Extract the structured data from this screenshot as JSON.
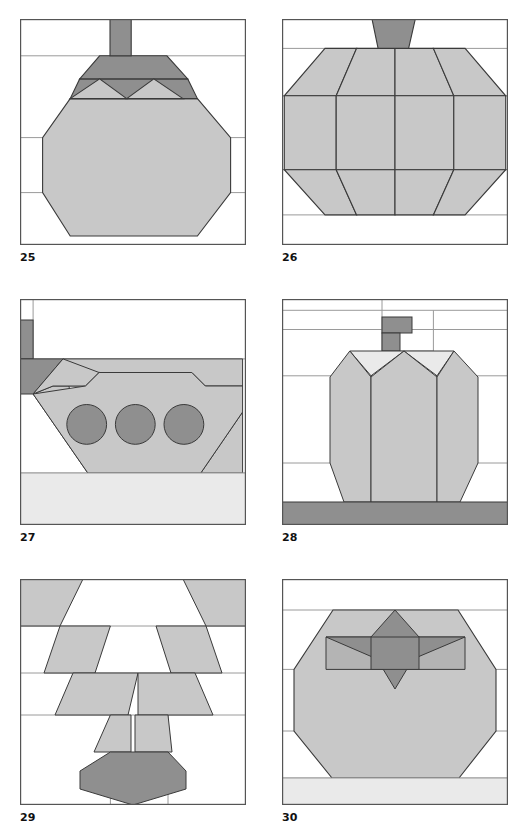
{
  "page": {
    "kind": "quilt-block-pattern-sheet",
    "columns": 2,
    "rows": 3,
    "background_color": "#ffffff"
  },
  "palette": {
    "white": "#ffffff",
    "pale_gray": "#eaeaea",
    "light_gray": "#c8c8c8",
    "mid_gray": "#b4b4b4",
    "dark_gray": "#8f8f8f",
    "outline": "#3a3a3a",
    "grid_line": "#9a9a9a",
    "label_color": "#111111"
  },
  "blocks": [
    {
      "label": "25",
      "name": "eggplant-block",
      "position": "row1-left",
      "grid_lines_h": [
        0.163,
        0.525,
        0.768
      ],
      "grid_lines_v": [
        0.352,
        0.653
      ],
      "shapes": [
        {
          "id": "stem",
          "fill": "dark_gray",
          "points": "0.398,0.000 0.492,0.000 0.492,0.163 0.398,0.163"
        },
        {
          "id": "cap-trapezoid",
          "fill": "dark_gray",
          "points": "0.352,0.163 0.650,0.163 0.742,0.265 0.264,0.265"
        },
        {
          "id": "cap-band-left-wedge",
          "fill": "dark_gray",
          "points": "0.264,0.265 0.742,0.265 0.785,0.352 0.222,0.352"
        },
        {
          "id": "leaf-point-left",
          "fill": "light_gray",
          "points": "0.222,0.352 0.352,0.265 0.472,0.352"
        },
        {
          "id": "leaf-point-right",
          "fill": "light_gray",
          "points": "0.472,0.352 0.592,0.265 0.722,0.352"
        },
        {
          "id": "body-octagon",
          "fill": "light_gray",
          "points": "0.222,0.352 0.785,0.352 0.932,0.525 0.932,0.768 0.785,0.960 0.222,0.960 0.100,0.768 0.100,0.525"
        }
      ]
    },
    {
      "label": "26",
      "name": "pumpkin-block",
      "position": "row1-right",
      "grid_lines_h": [
        0.13,
        0.34,
        0.667,
        0.867
      ],
      "grid_lines_v": [
        0.5
      ],
      "shapes": [
        {
          "id": "stem",
          "fill": "dark_gray",
          "points": "0.398,0.000 0.590,0.000 0.560,0.130 0.425,0.130"
        },
        {
          "id": "lobe-outer-left",
          "fill": "light_gray",
          "points": "0.190,0.130 0.330,0.130 0.240,0.340 0.010,0.340"
        },
        {
          "id": "lobe-inner-left",
          "fill": "light_gray",
          "points": "0.330,0.130 0.500,0.130 0.500,0.340 0.240,0.340"
        },
        {
          "id": "lobe-inner-right",
          "fill": "light_gray",
          "points": "0.500,0.130 0.670,0.130 0.760,0.340 0.500,0.340"
        },
        {
          "id": "lobe-outer-right",
          "fill": "light_gray",
          "points": "0.670,0.130 0.810,0.130 0.990,0.340 0.760,0.340"
        },
        {
          "id": "mid-band-far-left",
          "fill": "light_gray",
          "points": "0.010,0.340 0.240,0.340 0.240,0.667 0.010,0.667"
        },
        {
          "id": "mid-band-left",
          "fill": "light_gray",
          "points": "0.240,0.340 0.500,0.340 0.500,0.667 0.240,0.667"
        },
        {
          "id": "mid-band-right",
          "fill": "light_gray",
          "points": "0.500,0.340 0.760,0.340 0.760,0.667 0.500,0.667"
        },
        {
          "id": "mid-band-far-right",
          "fill": "light_gray",
          "points": "0.760,0.340 0.990,0.340 0.990,0.667 0.760,0.667"
        },
        {
          "id": "lobe-bottom-outer-left",
          "fill": "light_gray",
          "points": "0.010,0.667 0.240,0.667 0.330,0.867 0.190,0.867"
        },
        {
          "id": "lobe-bottom-inner-left",
          "fill": "light_gray",
          "points": "0.240,0.667 0.500,0.667 0.500,0.867 0.330,0.867"
        },
        {
          "id": "lobe-bottom-inner-right",
          "fill": "light_gray",
          "points": "0.500,0.667 0.760,0.667 0.670,0.867 0.500,0.867"
        },
        {
          "id": "lobe-bottom-outer-right",
          "fill": "light_gray",
          "points": "0.760,0.667 0.990,0.667 0.810,0.867 0.670,0.867"
        }
      ]
    },
    {
      "label": "27",
      "name": "basket-block",
      "position": "row2-left",
      "grid_lines_h": [
        0.265,
        0.77
      ],
      "grid_lines_v": [],
      "shapes": [
        {
          "id": "handle-upper",
          "fill": "dark_gray",
          "points": "0.000,0.093 0.058,0.093 0.058,0.265 0.000,0.265"
        },
        {
          "id": "handle-corner-wedge",
          "fill": "dark_gray",
          "points": "0.000,0.265 0.190,0.265 0.058,0.420 0.000,0.420"
        },
        {
          "id": "basket-body",
          "fill": "light_gray",
          "points": "0.190,0.265 0.985,0.265 0.985,0.500 0.800,0.770 0.300,0.770 0.058,0.420 0.110,0.385 0.290,0.385 0.350,0.325 0.760,0.325 0.820,0.385 0.985,0.385"
        },
        {
          "id": "basket-interior-cut",
          "fill": "white",
          "points": "0.230,0.265 0.950,0.265 0.800,0.325 0.350,0.325 0.290,0.385 0.145,0.385"
        },
        {
          "id": "egg-left",
          "fill": "dark_gray",
          "cx": 0.295,
          "cy": 0.555,
          "r": 0.088
        },
        {
          "id": "egg-center",
          "fill": "dark_gray",
          "cx": 0.51,
          "cy": 0.555,
          "r": 0.088
        },
        {
          "id": "egg-right",
          "fill": "dark_gray",
          "cx": 0.725,
          "cy": 0.555,
          "r": 0.088
        },
        {
          "id": "ground-strip",
          "fill": "pale_gray",
          "points": "0.000,0.770 1.000,0.770 1.000,1.000 0.000,1.000"
        }
      ]
    },
    {
      "label": "28",
      "name": "bell-pepper-block",
      "position": "row2-right",
      "grid_lines_h": [
        0.13,
        0.385,
        0.77,
        0.9
      ],
      "grid_lines_v": [
        0.46,
        0.68
      ],
      "shapes": [
        {
          "id": "stem-upper",
          "fill": "dark_gray",
          "points": "0.460,0.175 0.600,0.175 0.600,0.255 0.460,0.255"
        },
        {
          "id": "stem-lower",
          "fill": "dark_gray",
          "points": "0.460,0.255 0.545,0.255 0.545,0.385 0.460,0.385"
        },
        {
          "id": "shoulder-highlight",
          "fill": "pale_gray",
          "points": "0.300,0.385 0.760,0.385 0.690,0.460 0.540,0.385 0.390,0.460"
        },
        {
          "id": "lobe-left",
          "fill": "light_gray",
          "points": "0.300,0.385 0.390,0.470 0.390,0.900 0.300,0.900 0.200,0.770 0.210,0.470"
        },
        {
          "id": "lobe-center",
          "fill": "light_gray",
          "points": "0.390,0.470 0.540,0.385 0.690,0.470 0.690,0.900 0.390,0.900"
        },
        {
          "id": "lobe-right",
          "fill": "light_gray",
          "points": "0.690,0.470 0.790,0.385 0.880,0.470 0.870,0.770 0.790,0.900 0.690,0.900"
        },
        {
          "id": "base-shadow",
          "fill": "dark_gray",
          "points": "0.000,0.900 1.000,0.900 1.000,1.000 0.000,1.000"
        }
      ]
    },
    {
      "label": "29",
      "name": "beet-block",
      "position": "row3-left",
      "grid_lines_h": [
        0.225,
        0.45,
        0.64
      ],
      "grid_lines_v": [
        0.4,
        0.64
      ],
      "shapes": [
        {
          "id": "leaf-top-left",
          "fill": "light_gray",
          "points": "0.000,0.000 0.280,0.000 0.180,0.225 0.000,0.225"
        },
        {
          "id": "leaf-top-right",
          "fill": "light_gray",
          "points": "0.720,0.000 1.000,0.000 1.000,0.225 0.820,0.225"
        },
        {
          "id": "leaf-mid-left",
          "fill": "light_gray",
          "points": "0.180,0.225 0.400,0.225 0.330,0.450 0.105,0.450"
        },
        {
          "id": "leaf-mid-right",
          "fill": "light_gray",
          "points": "0.600,0.225 0.820,0.225 0.895,0.450 0.670,0.450"
        },
        {
          "id": "leaf-low-left",
          "fill": "light_gray",
          "points": "0.235,0.450 0.520,0.450 0.480,0.640 0.155,0.640"
        },
        {
          "id": "leaf-low-right",
          "fill": "light_gray",
          "points": "0.520,0.450 0.775,0.450 0.855,0.640 0.520,0.640"
        },
        {
          "id": "leaf-stem-left",
          "fill": "light_gray",
          "points": "0.400,0.640 0.490,0.640 0.490,0.800 0.330,0.800"
        },
        {
          "id": "leaf-stem-right",
          "fill": "light_gray",
          "points": "0.510,0.640 0.640,0.640 0.660,0.800 0.510,0.800"
        },
        {
          "id": "root-body",
          "fill": "dark_gray",
          "points": "0.400,0.800 0.640,0.800 0.735,0.880 0.735,1.000 0.575,1.000 0.305,1.000 0.305,0.880"
        }
      ]
    },
    {
      "label": "30",
      "name": "tomato-block",
      "position": "row3-right",
      "grid_lines_h": [
        0.155,
        0.4,
        0.66,
        0.88
      ],
      "grid_lines_v": [],
      "shapes": [
        {
          "id": "fruit-octagon",
          "fill": "light_gray",
          "points": "0.220,0.155 0.780,0.155 0.980,0.400 0.980,0.660 0.790,0.880 0.215,0.880 0.050,0.660 0.050,0.400"
        },
        {
          "id": "calyx-band",
          "fill": "mid_gray",
          "points": "0.200,0.290 0.800,0.290 0.800,0.400 0.200,0.400"
        },
        {
          "id": "calyx-star",
          "fill": "dark_gray",
          "points": "0.500,0.155 0.610,0.290 0.800,0.290 0.580,0.360 0.500,0.480 0.420,0.360 0.200,0.290 0.390,0.290"
        },
        {
          "id": "calyx-core",
          "fill": "dark_gray",
          "points": "0.420,0.290 0.580,0.290 0.580,0.400 0.420,0.400"
        },
        {
          "id": "ground-strip",
          "fill": "pale_gray",
          "points": "0.000,0.880 1.000,0.880 1.000,1.000 0.000,1.000"
        }
      ]
    }
  ]
}
